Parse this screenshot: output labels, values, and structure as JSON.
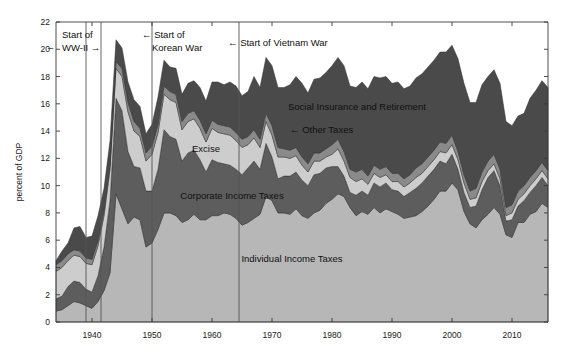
{
  "chart_data": {
    "type": "area",
    "title": "",
    "subtitle": "",
    "xlabel": "",
    "ylabel": "percent of GDP",
    "xlim": [
      1934,
      2016
    ],
    "ylim": [
      0,
      22
    ],
    "grid": false,
    "legend_position": "inline-labels",
    "stacked": true,
    "xticks": [
      1940,
      1950,
      1960,
      1970,
      1980,
      1990,
      2000,
      2010
    ],
    "xtick_labels": [
      "1940",
      "1950",
      "1960",
      "1970",
      "1980",
      "1990",
      "2000",
      "2010"
    ],
    "yticks": [
      0,
      2,
      4,
      6,
      8,
      10,
      12,
      14,
      16,
      18,
      20,
      22
    ],
    "ytick_labels": [
      "0",
      "2",
      "4",
      "6",
      "8",
      "10",
      "12",
      "14",
      "16",
      "18",
      "20",
      "22"
    ],
    "x": [
      1934,
      1935,
      1936,
      1937,
      1938,
      1939,
      1940,
      1941,
      1942,
      1943,
      1944,
      1945,
      1946,
      1947,
      1948,
      1949,
      1950,
      1951,
      1952,
      1953,
      1954,
      1955,
      1956,
      1957,
      1958,
      1959,
      1960,
      1961,
      1962,
      1963,
      1964,
      1965,
      1966,
      1967,
      1968,
      1969,
      1970,
      1971,
      1972,
      1973,
      1974,
      1975,
      1976,
      1977,
      1978,
      1979,
      1980,
      1981,
      1982,
      1983,
      1984,
      1985,
      1986,
      1987,
      1988,
      1989,
      1990,
      1991,
      1992,
      1993,
      1994,
      1995,
      1996,
      1997,
      1998,
      1999,
      2000,
      2001,
      2002,
      2003,
      2004,
      2005,
      2006,
      2007,
      2008,
      2009,
      2010,
      2011,
      2012,
      2013,
      2014,
      2015,
      2016
    ],
    "series": [
      {
        "name": "Individual Income Taxes",
        "color": "#b7b7b7",
        "label_x": 1980,
        "label_y": 4.2,
        "values": [
          0.8,
          0.9,
          1.2,
          1.5,
          1.4,
          1.2,
          1.0,
          1.5,
          2.3,
          3.6,
          9.4,
          8.3,
          7.2,
          7.7,
          7.5,
          5.5,
          5.8,
          6.8,
          8.0,
          8.0,
          7.8,
          7.3,
          7.5,
          7.9,
          7.5,
          7.5,
          7.8,
          7.8,
          8.0,
          7.9,
          7.6,
          7.1,
          7.3,
          7.6,
          7.9,
          9.2,
          8.9,
          8.0,
          8.0,
          7.9,
          8.3,
          7.8,
          7.6,
          8.0,
          8.2,
          8.7,
          9.0,
          9.4,
          9.2,
          8.4,
          7.8,
          8.1,
          7.9,
          8.4,
          8.0,
          8.3,
          8.1,
          7.9,
          7.6,
          7.7,
          7.8,
          8.1,
          8.5,
          9.0,
          9.6,
          9.6,
          10.2,
          9.7,
          8.1,
          7.2,
          6.9,
          7.5,
          7.9,
          8.4,
          7.9,
          6.4,
          6.2,
          7.3,
          7.3,
          7.9,
          8.1,
          8.7,
          8.4
        ]
      },
      {
        "name": "Corporate Income Taxes",
        "color": "#5d5d5d",
        "label_x": 1965,
        "label_y": 9.4,
        "values": [
          0.9,
          1.0,
          1.4,
          1.5,
          1.5,
          1.2,
          1.2,
          1.9,
          3.2,
          5.3,
          7.0,
          7.2,
          5.3,
          3.7,
          3.8,
          4.1,
          3.8,
          4.4,
          6.1,
          5.6,
          5.6,
          4.5,
          4.9,
          4.7,
          4.4,
          3.5,
          4.1,
          3.9,
          3.6,
          3.6,
          3.6,
          3.7,
          4.0,
          4.2,
          3.3,
          3.9,
          3.2,
          2.5,
          2.7,
          2.8,
          2.7,
          2.6,
          2.4,
          2.8,
          2.7,
          2.6,
          2.4,
          2.0,
          1.5,
          1.1,
          1.5,
          1.5,
          1.4,
          1.8,
          1.9,
          1.9,
          1.6,
          1.7,
          1.6,
          1.8,
          2.0,
          2.1,
          2.2,
          2.2,
          2.2,
          2.0,
          2.1,
          1.5,
          1.4,
          1.2,
          1.6,
          2.2,
          2.7,
          2.7,
          2.1,
          1.0,
          1.3,
          1.2,
          1.6,
          1.6,
          1.9,
          1.9,
          1.6
        ]
      },
      {
        "name": "Excise",
        "color": "#cdcdcd",
        "label_x": 1957,
        "label_y": 12.0,
        "values": [
          2.0,
          2.1,
          1.9,
          1.9,
          1.9,
          1.9,
          2.0,
          2.2,
          2.3,
          2.3,
          2.2,
          2.5,
          2.9,
          2.6,
          2.3,
          2.2,
          2.7,
          2.7,
          2.6,
          2.7,
          2.7,
          2.3,
          2.3,
          2.3,
          2.3,
          2.2,
          2.3,
          2.2,
          2.2,
          2.2,
          2.1,
          2.0,
          1.7,
          1.7,
          1.6,
          1.6,
          1.6,
          1.6,
          1.4,
          1.3,
          1.2,
          1.1,
          1.0,
          1.0,
          0.9,
          0.8,
          0.9,
          1.3,
          1.1,
          1.1,
          1.0,
          0.9,
          0.8,
          0.7,
          0.7,
          0.6,
          0.6,
          0.7,
          0.7,
          0.7,
          0.8,
          0.7,
          0.7,
          0.7,
          0.7,
          0.8,
          0.7,
          0.7,
          0.7,
          0.6,
          0.6,
          0.6,
          0.5,
          0.5,
          0.5,
          0.4,
          0.5,
          0.5,
          0.5,
          0.5,
          0.5,
          0.5,
          0.5
        ]
      },
      {
        "name": "Other Taxes",
        "color": "#8a8a8a",
        "label_x": 1971,
        "label_y": 13.6,
        "values": [
          0.5,
          0.5,
          0.5,
          0.4,
          0.4,
          0.4,
          0.4,
          0.4,
          0.4,
          0.4,
          0.5,
          0.6,
          0.7,
          0.7,
          0.6,
          0.6,
          0.6,
          0.6,
          0.6,
          0.6,
          0.6,
          0.6,
          0.6,
          0.6,
          0.6,
          0.6,
          0.6,
          0.6,
          0.6,
          0.6,
          0.6,
          0.6,
          0.6,
          0.6,
          0.6,
          0.6,
          0.7,
          0.7,
          0.6,
          0.6,
          0.6,
          0.6,
          0.6,
          0.6,
          0.6,
          0.6,
          0.7,
          0.7,
          0.7,
          0.6,
          0.7,
          0.7,
          0.6,
          0.6,
          0.6,
          0.6,
          0.6,
          0.6,
          0.6,
          0.6,
          0.7,
          0.7,
          0.7,
          0.7,
          0.7,
          0.7,
          0.7,
          0.6,
          0.6,
          0.6,
          0.7,
          0.7,
          0.7,
          0.7,
          0.7,
          0.6,
          0.6,
          0.6,
          0.6,
          0.6,
          0.6,
          0.6,
          0.6
        ]
      },
      {
        "name": "Social Insurance and Retirement",
        "color": "#4a4a4a",
        "label_x": 1985,
        "label_y": 15.2,
        "values": [
          0.3,
          0.7,
          0.8,
          1.6,
          1.8,
          1.5,
          1.7,
          1.8,
          1.6,
          1.7,
          1.6,
          1.5,
          1.5,
          1.6,
          1.6,
          1.4,
          1.6,
          2.0,
          1.9,
          1.8,
          1.9,
          2.0,
          2.2,
          2.2,
          2.4,
          2.4,
          2.8,
          3.1,
          3.0,
          3.3,
          3.4,
          3.2,
          3.3,
          3.9,
          3.8,
          4.1,
          4.4,
          4.4,
          4.5,
          4.8,
          5.2,
          5.4,
          5.2,
          5.4,
          5.5,
          5.6,
          5.8,
          6.0,
          6.3,
          6.1,
          6.2,
          6.4,
          6.4,
          6.5,
          6.7,
          6.6,
          6.6,
          6.7,
          6.6,
          6.5,
          6.6,
          6.6,
          6.6,
          6.6,
          6.6,
          6.7,
          6.6,
          6.8,
          6.7,
          6.5,
          6.3,
          6.4,
          6.2,
          6.2,
          6.3,
          6.3,
          5.8,
          5.5,
          5.3,
          5.8,
          5.9,
          6.0,
          6.1
        ]
      }
    ],
    "annotations": [
      {
        "id": "ww2",
        "line1": "Start of",
        "line2": "WW-II",
        "left_arrow": "←",
        "right_arrow": "→",
        "event_year": 1939,
        "event_year_end": 1941.5
      },
      {
        "id": "korea",
        "line1": "Start of",
        "line2": "Korean War",
        "left_arrow": "←",
        "right_arrow": "",
        "event_year": 1950
      },
      {
        "id": "vietnam",
        "line1": "Start of Vietnam War",
        "line2": "",
        "left_arrow": "←",
        "right_arrow": "",
        "event_year": 1964.5
      }
    ]
  }
}
